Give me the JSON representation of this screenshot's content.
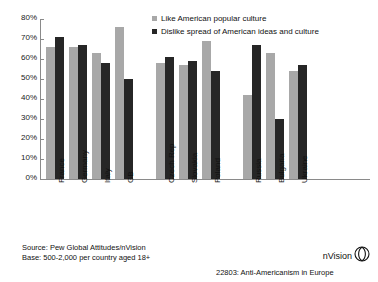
{
  "title_strip": "",
  "legend": {
    "position": "top-center",
    "items": [
      {
        "label": "Like American popular culture",
        "color": "#a8a8a8",
        "key": "like"
      },
      {
        "label": "Dislike spread of American ideas and culture",
        "color": "#262626",
        "key": "dislike"
      }
    ]
  },
  "axis": {
    "y_ticks": [
      "80%",
      "70%",
      "60%",
      "50%",
      "40%",
      "30%",
      "20%",
      "10%",
      "0%"
    ]
  },
  "footer": {
    "source_line1": "Source: Pew Global Attitudes/nVision",
    "source_line2": "Base: 500-2,000 per country aged 18+",
    "caption": "22803: Anti-Americanism in Europe",
    "brand": "nVision"
  },
  "chart_data": {
    "type": "bar",
    "title": "",
    "subtitle": "",
    "xlabel": "",
    "ylabel": "",
    "ylim": [
      0,
      80
    ],
    "ytick_step": 10,
    "grid": false,
    "legend_position": "top-center",
    "categories": [
      "France",
      "Germany",
      "Italy",
      "GB",
      "Czech Rep",
      "Slovakia",
      "Poland",
      "Russia",
      "Bulgaria",
      "Ukraine"
    ],
    "group_breaks": [
      4,
      7
    ],
    "series": [
      {
        "name": "Like American popular culture",
        "color": "#a8a8a8",
        "values": [
          66,
          66,
          63,
          76,
          58,
          57,
          69,
          42,
          63,
          54
        ]
      },
      {
        "name": "Dislike spread of American ideas and culture",
        "color": "#262626",
        "values": [
          71,
          67,
          58,
          50,
          61,
          59,
          54,
          67,
          30,
          57
        ]
      }
    ]
  }
}
